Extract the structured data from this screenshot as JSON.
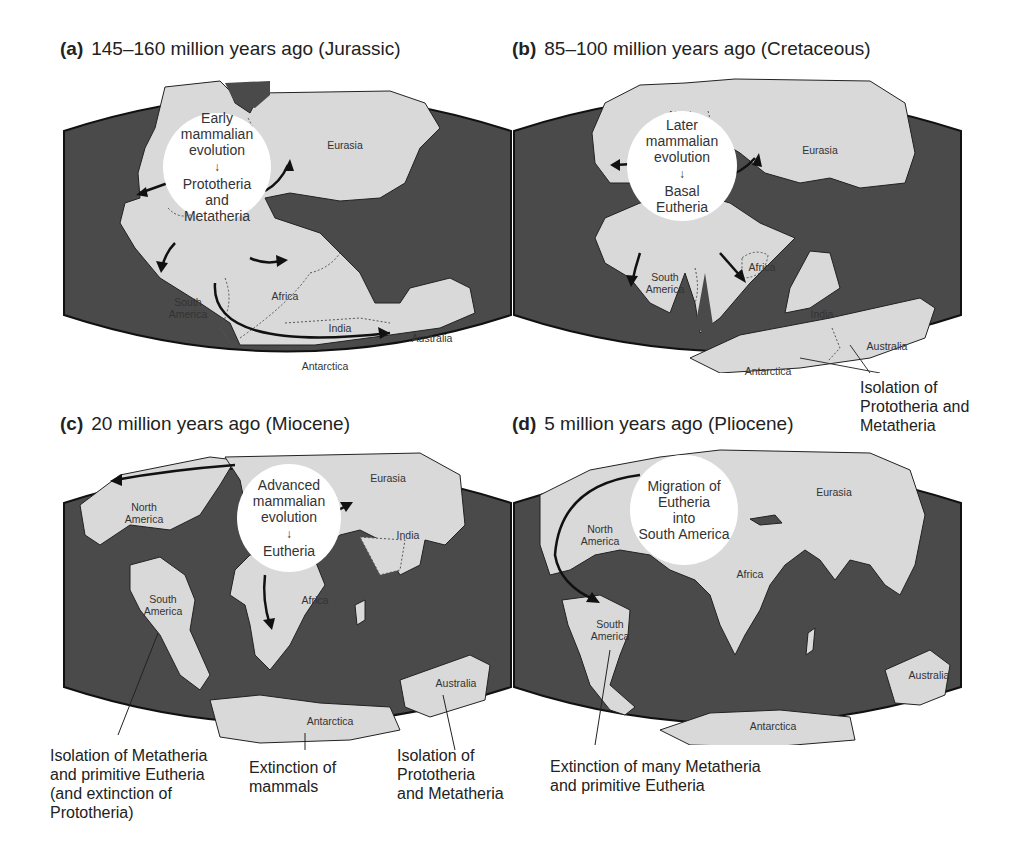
{
  "colors": {
    "ocean": "#4a4a4a",
    "land": "#d9d9d9",
    "callout": "#ffffff",
    "text": "#222222"
  },
  "panels": [
    {
      "letter": "(a)",
      "title": "145–160 million years ago (Jurassic)",
      "callout": {
        "top": "Early mammalian evolution",
        "line1": "Early",
        "line2": "mammalian",
        "line3": "evolution",
        "arrow": "↓",
        "bottom1": "Prototheria",
        "bottom2": "and",
        "bottom3": "Metatheria"
      },
      "labels": {
        "north_america_1": "North",
        "north_america_2": "America",
        "eurasia": "Eurasia",
        "south_america_1": "South",
        "south_america_2": "America",
        "africa": "Africa",
        "india": "India",
        "australia": "Australia",
        "antarctica": "Antarctica"
      }
    },
    {
      "letter": "(b)",
      "title": "85–100 million years ago (Cretaceous)",
      "callout": {
        "line1": "Later",
        "line2": "mammalian",
        "line3": "evolution",
        "arrow": "↓",
        "bottom1": "Basal",
        "bottom2": "Eutheria"
      },
      "labels": {
        "north_america_1": "North",
        "north_america_2": "America",
        "eurasia": "Eurasia",
        "south_america_1": "South",
        "south_america_2": "America",
        "africa": "Africa",
        "india": "India",
        "australia": "Australia",
        "antarctica": "Antarctica"
      },
      "annotation": {
        "line1": "Isolation of",
        "line2": "Prototheria and",
        "line3": "Metatheria"
      }
    },
    {
      "letter": "(c)",
      "title": "20 million years ago (Miocene)",
      "callout": {
        "line1": "Advanced",
        "line2": "mammalian",
        "line3": "evolution",
        "arrow": "↓",
        "bottom1": "Eutheria"
      },
      "labels": {
        "north_america_1": "North",
        "north_america_2": "America",
        "eurasia": "Eurasia",
        "india": "India",
        "south_america_1": "South",
        "south_america_2": "America",
        "africa": "Africa",
        "australia": "Australia",
        "antarctica": "Antarctica"
      },
      "annotations": [
        {
          "line1": "Isolation of Metatheria",
          "line2": "and primitive Eutheria",
          "line3": "(and extinction of",
          "line4": "Prototheria)"
        },
        {
          "line1": "Extinction of",
          "line2": "mammals"
        },
        {
          "line1": "Isolation of",
          "line2": "Prototheria",
          "line3": "and Metatheria"
        }
      ]
    },
    {
      "letter": "(d)",
      "title": "5 million years ago (Pliocene)",
      "callout": {
        "line1": "Migration of",
        "line2": "Eutheria",
        "line3": "into",
        "line4": "South America"
      },
      "labels": {
        "north_america_1": "North",
        "north_america_2": "America",
        "eurasia": "Eurasia",
        "africa": "Africa",
        "south_america_1": "South",
        "south_america_2": "America",
        "australia": "Australia",
        "antarctica": "Antarctica"
      },
      "annotation": {
        "line1": "Extinction of many Metatheria",
        "line2": "and primitive Eutheria"
      }
    }
  ]
}
